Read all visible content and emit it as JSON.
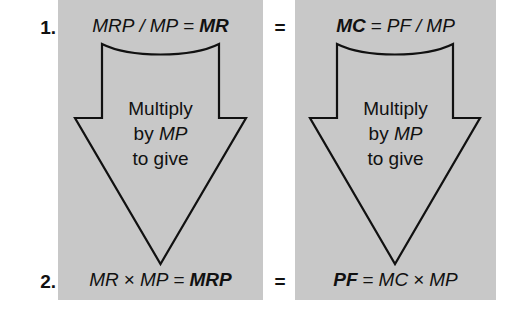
{
  "diagram": {
    "background_color": "#ffffff",
    "panel_color": "#c8c8c8",
    "line_color": "#111111",
    "width": 516,
    "height": 324,
    "rows": [
      {
        "number": "1."
      },
      {
        "number": "2."
      }
    ],
    "equals_top": "=",
    "equals_bottom": "=",
    "panels": [
      {
        "id": "left",
        "top_formula": {
          "full": "MRP / MP = MR",
          "lhs_numerator": "MRP",
          "operator_divide": "/",
          "lhs_denominator": "MP",
          "equals": "=",
          "rhs": "MR",
          "emphasis": "rhs"
        },
        "arrow_text": [
          "Multiply",
          "by MP",
          "to give"
        ],
        "arrow_text_italic_token": "MP",
        "bottom_formula": {
          "full": "MR × MP = MRP",
          "lhs_first": "MR",
          "operator_times": "×",
          "lhs_second": "MP",
          "equals": "=",
          "rhs": "MRP",
          "emphasis": "rhs"
        }
      },
      {
        "id": "right",
        "top_formula": {
          "full": "MC = PF / MP",
          "lhs": "MC",
          "equals": "=",
          "rhs_numerator": "PF",
          "operator_divide": "/",
          "rhs_denominator": "MP",
          "emphasis": "lhs"
        },
        "arrow_text": [
          "Multiply",
          "by MP",
          "to give"
        ],
        "arrow_text_italic_token": "MP",
        "bottom_formula": {
          "full": "PF = MC × MP",
          "lhs": "PF",
          "equals": "=",
          "rhs_first": "MC",
          "operator_times": "×",
          "rhs_second": "MP",
          "emphasis": "lhs"
        }
      }
    ]
  }
}
